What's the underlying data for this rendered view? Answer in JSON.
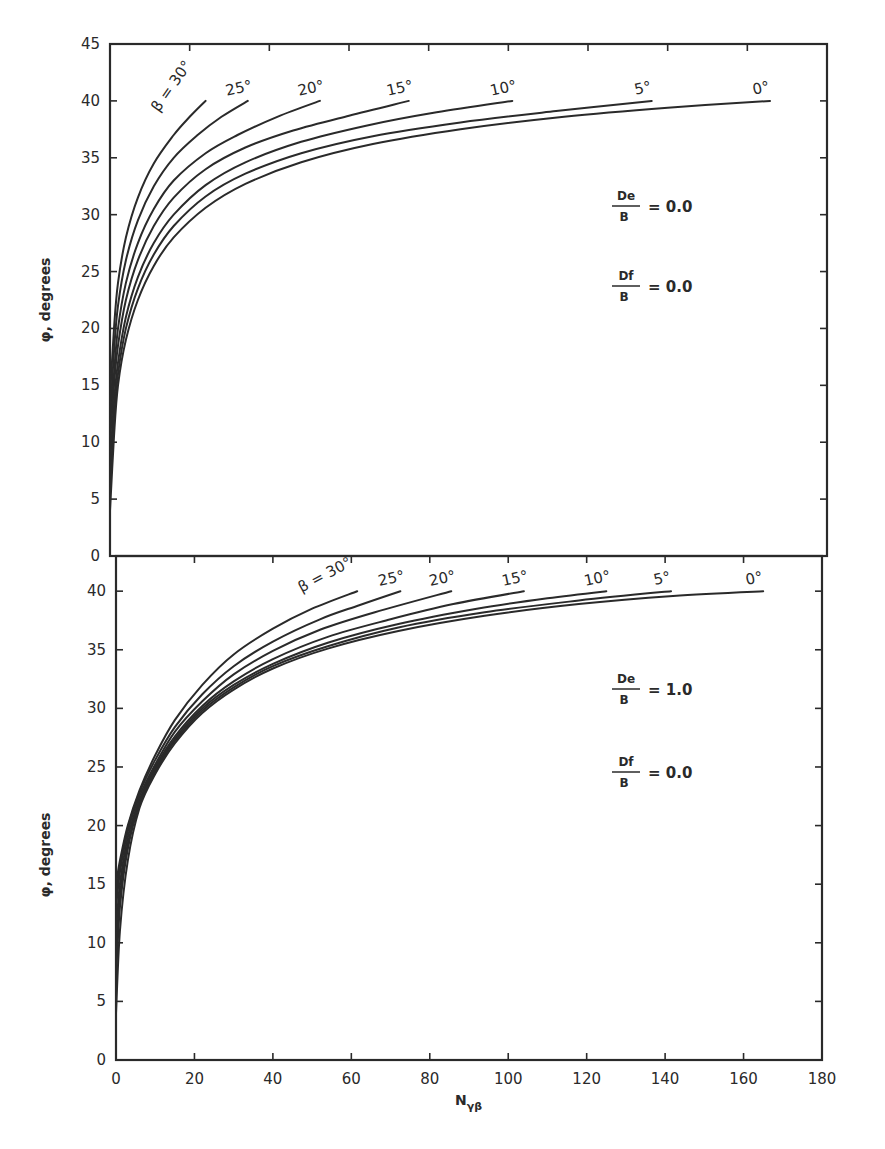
{
  "chart_data": [
    {
      "type": "line",
      "panel": "top",
      "title": "",
      "xlabel": "N_γβ",
      "ylabel": "φ, degrees",
      "xlim": [
        0,
        180
      ],
      "ylim": [
        0,
        45
      ],
      "yticks": [
        0,
        5,
        10,
        15,
        20,
        25,
        30,
        35,
        40,
        45
      ],
      "grid": false,
      "annotations": [
        "De/B = 0.0",
        "Df/B = 0.0"
      ],
      "annotation_parts": [
        {
          "num": "De",
          "den": "B",
          "value": "= 0.0"
        },
        {
          "num": "Df",
          "den": "B",
          "value": "= 0.0"
        }
      ],
      "series": [
        {
          "name": "β = 30°",
          "label": "β = 30°",
          "x": [
            0,
            1,
            2,
            4,
            7,
            11,
            16,
            20,
            24
          ],
          "y": [
            14,
            20,
            24,
            28,
            31.5,
            34.5,
            37,
            38.6,
            40
          ]
        },
        {
          "name": "β = 25°",
          "label": "25°",
          "x": [
            0,
            1,
            2,
            4,
            7,
            11,
            16,
            22,
            28,
            34.6
          ],
          "y": [
            12,
            18,
            22,
            26,
            29.5,
            32.5,
            35,
            37,
            38.6,
            40
          ]
        },
        {
          "name": "β = 20°",
          "label": "20°",
          "x": [
            0,
            1,
            2,
            4,
            7,
            11,
            16,
            24,
            32,
            42,
            52.7
          ],
          "y": [
            11,
            16,
            20,
            24,
            27.5,
            30.5,
            33,
            35.4,
            37,
            38.6,
            40
          ]
        },
        {
          "name": "β = 15°",
          "label": "15°",
          "x": [
            0,
            1,
            2,
            4,
            7,
            11,
            16,
            24,
            34,
            46,
            60,
            75
          ],
          "y": [
            10,
            15,
            18.5,
            22.5,
            26,
            29,
            31.5,
            34,
            35.9,
            37.4,
            38.7,
            40
          ]
        },
        {
          "name": "β = 10°",
          "label": "10°",
          "x": [
            0,
            1,
            2,
            4,
            7,
            11,
            16,
            24,
            34,
            48,
            64,
            82,
            101
          ],
          "y": [
            8,
            13.5,
            17,
            21,
            24.5,
            27.5,
            30,
            32.6,
            34.6,
            36.4,
            37.8,
            39,
            40
          ]
        },
        {
          "name": "β = 5°",
          "label": "5°",
          "x": [
            0,
            1,
            2,
            4,
            7,
            11,
            16,
            24,
            34,
            48,
            66,
            88,
            112,
            136
          ],
          "y": [
            6,
            12,
            16,
            20,
            23.5,
            26.5,
            29,
            31.6,
            33.6,
            35.4,
            36.9,
            38.1,
            39.1,
            40
          ]
        },
        {
          "name": "β = 0°",
          "label": "0°",
          "x": [
            0,
            1,
            2,
            4,
            7,
            11,
            16,
            24,
            34,
            48,
            66,
            88,
            114,
            140,
            165.7
          ],
          "y": [
            4,
            10.5,
            15,
            19,
            22.5,
            25.5,
            28,
            30.6,
            32.7,
            34.6,
            36.2,
            37.5,
            38.6,
            39.4,
            40
          ]
        }
      ]
    },
    {
      "type": "line",
      "panel": "bottom",
      "title": "",
      "xlabel": "N_γβ",
      "ylabel": "φ, degrees",
      "xlim": [
        0,
        180
      ],
      "ylim": [
        0,
        40
      ],
      "xticks": [
        0,
        20,
        40,
        60,
        80,
        100,
        120,
        140,
        160,
        180
      ],
      "yticks": [
        0,
        5,
        10,
        15,
        20,
        25,
        30,
        35,
        40
      ],
      "grid": false,
      "annotations": [
        "De/B = 1.0",
        "Df/B = 0.0"
      ],
      "annotation_parts": [
        {
          "num": "De",
          "den": "B",
          "value": "= 1.0"
        },
        {
          "num": "Df",
          "den": "B",
          "value": "= 0.0"
        }
      ],
      "series": [
        {
          "name": "β = 30°",
          "label": "β = 30°",
          "x": [
            0,
            1,
            3,
            6,
            10,
            15,
            22,
            30,
            40,
            50,
            61.5
          ],
          "y": [
            15,
            17,
            20,
            23,
            26,
            29,
            32,
            34.6,
            36.8,
            38.5,
            40
          ]
        },
        {
          "name": "β = 25°",
          "label": "25°",
          "x": [
            0,
            1,
            3,
            6,
            10,
            15,
            22,
            30,
            40,
            52,
            62,
            72.5
          ],
          "y": [
            14,
            16.5,
            19.8,
            22.8,
            25.6,
            28.4,
            31.2,
            33.6,
            35.7,
            37.6,
            38.8,
            40
          ]
        },
        {
          "name": "β = 20°",
          "label": "20°",
          "x": [
            0,
            1,
            3,
            6,
            10,
            15,
            22,
            30,
            40,
            52,
            66,
            85.5
          ],
          "y": [
            13,
            16,
            19.5,
            22.5,
            25.2,
            28,
            30.6,
            32.9,
            34.9,
            36.7,
            38.2,
            40
          ]
        },
        {
          "name": "β = 15°",
          "label": "15°",
          "x": [
            0,
            1,
            3,
            6,
            10,
            15,
            22,
            30,
            40,
            54,
            70,
            86,
            104
          ],
          "y": [
            11,
            15,
            19,
            22.2,
            25,
            27.6,
            30.2,
            32.3,
            34.2,
            36.1,
            37.6,
            38.9,
            40
          ]
        },
        {
          "name": "β = 10°",
          "label": "10°",
          "x": [
            0,
            1,
            3,
            6,
            10,
            15,
            22,
            30,
            40,
            54,
            72,
            92,
            110,
            125
          ],
          "y": [
            9,
            14,
            18.5,
            22,
            24.8,
            27.4,
            30,
            32,
            33.8,
            35.6,
            37.2,
            38.5,
            39.4,
            40
          ]
        },
        {
          "name": "β = 5°",
          "label": "5°",
          "x": [
            0,
            1,
            3,
            6,
            10,
            15,
            22,
            30,
            40,
            54,
            72,
            94,
            118,
            141.5
          ],
          "y": [
            7,
            13,
            18,
            21.8,
            24.6,
            27.2,
            29.8,
            31.8,
            33.6,
            35.3,
            36.9,
            38.2,
            39.2,
            40
          ]
        },
        {
          "name": "β = 0°",
          "label": "0°",
          "x": [
            0,
            1,
            3,
            6,
            10,
            15,
            22,
            30,
            40,
            54,
            72,
            94,
            118,
            142,
            165
          ],
          "y": [
            4,
            11,
            17,
            21.5,
            24.4,
            27,
            29.6,
            31.6,
            33.4,
            35.1,
            36.6,
            37.9,
            38.9,
            39.6,
            40
          ]
        }
      ]
    }
  ],
  "axes": {
    "ylabel": "φ, degrees",
    "xlabel": "N",
    "xlabel_sub": "γβ"
  },
  "layout": {
    "top": {
      "x0": 110,
      "x1": 827,
      "y_top": 44,
      "y_bottom": 556,
      "ymax": 45,
      "ymin": 0,
      "xmax": 180
    },
    "bottom": {
      "x0": 116,
      "x1": 822,
      "y_top": 556,
      "y_bottom": 1060,
      "ymax": 43,
      "ymin": 0,
      "xmax": 180
    }
  }
}
